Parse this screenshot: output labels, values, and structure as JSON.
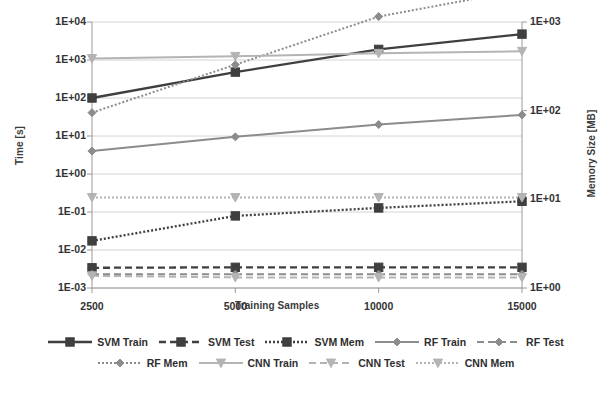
{
  "chart_data": {
    "type": "line",
    "title": "",
    "xlabel": "Training Samples",
    "ylabel": "Time [s]",
    "ylabel_right": "Memory Size [MB]",
    "x": [
      2500,
      5000,
      10000,
      15000
    ],
    "categories": [
      "2500",
      "5000",
      "10000",
      "15000"
    ],
    "xticklabels": [
      "2500",
      "5000",
      "10000",
      "15000"
    ],
    "yscale": "log",
    "ylim": [
      0.001,
      10000
    ],
    "yticklabels": [
      "1E+04",
      "1E+03",
      "1E+02",
      "1E+01",
      "1E+00",
      "1E-01",
      "1E-02",
      "1E-03"
    ],
    "ytickvalues": [
      10000,
      1000,
      100,
      10,
      1,
      0.1,
      0.01,
      0.001
    ],
    "yscale_right": "log",
    "ylim_right": [
      1,
      1000
    ],
    "yticklabels_right": [
      "1E+03",
      "1E+02",
      "1E+01",
      "1E+00"
    ],
    "ytickvalues_right": [
      1000,
      100,
      10,
      1
    ],
    "grid": true,
    "legend_position": "bottom",
    "series": [
      {
        "name": "SVM Train",
        "axis": "left",
        "unit": "s",
        "marker": "square",
        "linestyle": "solid",
        "color": "#3f3f3f",
        "values": [
          100,
          480,
          1900,
          4800
        ]
      },
      {
        "name": "SVM Test",
        "axis": "left",
        "unit": "s",
        "marker": "square",
        "linestyle": "dashed",
        "color": "#3f3f3f",
        "values": [
          0.0034,
          0.0035,
          0.0035,
          0.0035
        ]
      },
      {
        "name": "SVM Mem",
        "axis": "right",
        "unit": "MB",
        "marker": "square",
        "linestyle": "dotted",
        "color": "#3f3f3f",
        "values": [
          3.4,
          6.5,
          8.0,
          9.5
        ]
      },
      {
        "name": "RF Train",
        "axis": "left",
        "unit": "s",
        "marker": "diamond",
        "linestyle": "solid",
        "color": "#8c8c8c",
        "values": [
          4.0,
          9.5,
          20.0,
          36.0
        ]
      },
      {
        "name": "RF Test",
        "axis": "left",
        "unit": "s",
        "marker": "diamond",
        "linestyle": "dashed",
        "color": "#8c8c8c",
        "values": [
          0.0023,
          0.0023,
          0.0023,
          0.0023
        ]
      },
      {
        "name": "RF Mem",
        "axis": "right",
        "unit": "MB",
        "marker": "diamond",
        "linestyle": "dotted",
        "color": "#8c8c8c",
        "values": [
          95,
          330,
          1150,
          2300
        ]
      },
      {
        "name": "CNN Train",
        "axis": "left",
        "unit": "s",
        "marker": "triangle",
        "linestyle": "solid",
        "color": "#b4b4b4",
        "values": [
          1100,
          1250,
          1500,
          1700
        ]
      },
      {
        "name": "CNN Test",
        "axis": "left",
        "unit": "s",
        "marker": "triangle",
        "linestyle": "dashed",
        "color": "#b4b4b4",
        "values": [
          0.0021,
          0.0019,
          0.0019,
          0.0019
        ]
      },
      {
        "name": "CNN Mem",
        "axis": "right",
        "unit": "MB",
        "marker": "triangle",
        "linestyle": "dotted",
        "color": "#b4b4b4",
        "values": [
          10.5,
          10.5,
          10.5,
          10.5
        ]
      }
    ]
  },
  "axes": {
    "left_title": "Time [s]",
    "right_title": "Memory Size [MB]",
    "x_title": "Training Samples",
    "left_ticks": [
      "1E+04",
      "1E+03",
      "1E+02",
      "1E+01",
      "1E+00",
      "1E-01",
      "1E-02",
      "1E-03"
    ],
    "right_ticks": [
      "1E+03",
      "1E+02",
      "1E+01",
      "1E+00"
    ],
    "x_ticks": [
      "2500",
      "5000",
      "10000",
      "15000"
    ]
  },
  "legend": {
    "row1": [
      {
        "label": "SVM Train"
      },
      {
        "label": "SVM Test"
      },
      {
        "label": "SVM Mem"
      },
      {
        "label": "RF Train"
      },
      {
        "label": "RF Test"
      }
    ],
    "row2": [
      {
        "label": "RF Mem"
      },
      {
        "label": "CNN Train"
      },
      {
        "label": "CNN Test"
      },
      {
        "label": "CNN Mem"
      }
    ]
  },
  "colors": {
    "svm": "#3f3f3f",
    "rf": "#8c8c8c",
    "cnn": "#b4b4b4",
    "grid": "#c9c9c9",
    "axis": "#9a9a9a",
    "text": "#2e2e2e"
  }
}
